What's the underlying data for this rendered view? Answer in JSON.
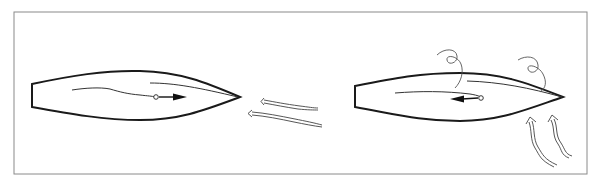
{
  "figure": {
    "colors": {
      "line": "#1a1a1a",
      "frame": "#8a8a8a",
      "background": "#ffffff"
    },
    "panels": [
      {
        "name": "left-boat",
        "motion_arrow": "forward",
        "flow_arrows": 2,
        "flow_direction": "head-on from bow"
      },
      {
        "name": "right-boat",
        "motion_arrow": "backward",
        "flow_arrows": 2,
        "flow_direction": "from below toward bow",
        "eddies": 2
      }
    ]
  }
}
